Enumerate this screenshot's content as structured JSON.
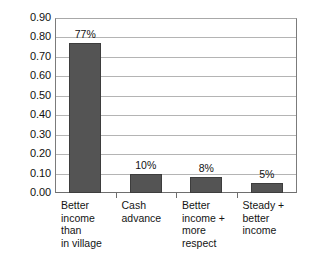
{
  "chart_data": {
    "type": "bar",
    "title": "",
    "subtitle": "",
    "xlabel": "",
    "ylabel": "",
    "categories": [
      "Better\nincome than\nin village",
      "Cash\nadvance",
      "Better\nincome +\nmore\nrespect",
      "Steady +\nbetter\nincome"
    ],
    "values": [
      0.77,
      0.1,
      0.08,
      0.05
    ],
    "data_labels": [
      "77%",
      "10%",
      "8%",
      "5%"
    ],
    "ylim": [
      0.0,
      0.9
    ],
    "ytick_step": 0.1,
    "ytick_labels": [
      "0.90",
      "0.80",
      "0.70",
      "0.60",
      "0.50",
      "0.40",
      "0.30",
      "0.20",
      "0.10",
      "0.00"
    ],
    "ytick_values": [
      0.9,
      0.8,
      0.7,
      0.6,
      0.5,
      0.4,
      0.3,
      0.2,
      0.1,
      0.0
    ],
    "grid": true,
    "grid_axis": "y",
    "legend": false,
    "legend_position": "none",
    "series": [
      {
        "name": "",
        "values": [
          0.77,
          0.1,
          0.08,
          0.05
        ]
      }
    ],
    "colors": {
      "bar_fill": "#545454",
      "bar_border": "#3d3d3d",
      "gridline": "#b4b4b4",
      "axis": "#6e6e6e",
      "plot_background": "#ffffff",
      "text": "#111111"
    }
  }
}
